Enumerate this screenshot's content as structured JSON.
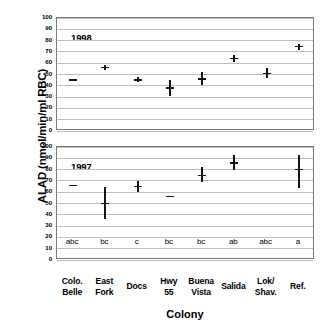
{
  "chart_data": {
    "type": "scatter",
    "title": "",
    "xlabel": "Colony",
    "ylabel": "ALAD (nmol/min/ml RBC)",
    "ylim": [
      0,
      100
    ],
    "yticks": [
      0,
      10,
      20,
      30,
      40,
      50,
      60,
      70,
      80,
      90,
      100
    ],
    "grid": true,
    "legend": "none",
    "categories": [
      "Colo. Belle",
      "East Fork",
      "Docs",
      "Hwy 55",
      "Buena Vista",
      "Salida",
      "Lok/ Shav.",
      "Ref."
    ],
    "category_lines": [
      [
        "Colo.",
        "Belle"
      ],
      [
        "East",
        "Fork"
      ],
      [
        "Docs",
        ""
      ],
      [
        "Hwy",
        "55"
      ],
      [
        "Buena",
        "Vista"
      ],
      [
        "Salida",
        ""
      ],
      [
        "Lok/",
        "Shav."
      ],
      [
        "Ref.",
        ""
      ]
    ],
    "significance_letters": [
      "abc",
      "bc",
      "c",
      "bc",
      "bc",
      "ab",
      "abc",
      "a"
    ],
    "panels": [
      {
        "tag": "1998",
        "values": [
          45,
          56,
          45,
          38,
          46,
          64,
          51,
          75
        ],
        "low": [
          45,
          54,
          43,
          31,
          41,
          61,
          47,
          72
        ],
        "high": [
          45,
          58,
          48,
          45,
          52,
          67,
          56,
          77
        ]
      },
      {
        "tag": "1997",
        "values": [
          66,
          50,
          65,
          56,
          75,
          86,
          null,
          80
        ],
        "low": [
          66,
          36,
          60,
          56,
          69,
          80,
          null,
          64
        ],
        "high": [
          66,
          65,
          70,
          56,
          82,
          93,
          null,
          93
        ]
      }
    ]
  }
}
